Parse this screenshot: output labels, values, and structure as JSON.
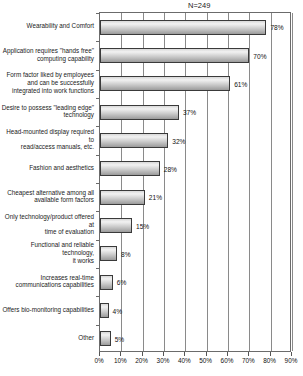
{
  "chart_data": {
    "type": "bar",
    "orientation": "horizontal",
    "title": "N=249",
    "xlabel": "",
    "ylabel": "",
    "xlim": [
      0,
      90
    ],
    "xticks": [
      0,
      10,
      20,
      30,
      40,
      50,
      60,
      70,
      80,
      90
    ],
    "xtick_labels": [
      "0%",
      "10%",
      "20%",
      "30%",
      "40%",
      "50%",
      "60%",
      "70%",
      "80%",
      "90%"
    ],
    "grid": true,
    "legend": false,
    "categories": [
      "Wearability and Comfort",
      "Application requires \"hands free\"\ncomputing capability",
      "Form factor liked by employees\nand can be successfully\nintegrated into work functions",
      "Desire to possess \"leading edge\"\ntechnology",
      "Head-mounted display required to\nread/access manuals, etc.",
      "Fashion and aesthetics",
      "Cheapest alternative among all\navailable form factors",
      "Only technology/product offered at\ntime of evaluation",
      "Functional and reliable technology,\nit works",
      "Increases real-time\ncommunications capabilities",
      "Offers bio-monitoring capabilities",
      "Other"
    ],
    "values": [
      78,
      70,
      61,
      37,
      32,
      28,
      21,
      15,
      8,
      6,
      4,
      5
    ],
    "value_labels": [
      "78%",
      "70%",
      "61%",
      "37%",
      "32%",
      "28%",
      "21%",
      "15%",
      "8%",
      "6%",
      "4%",
      "5%"
    ]
  },
  "style": {
    "bar_fill_light": "#f2f2f2",
    "bar_fill_dark": "#9a9a9a",
    "bar_border": "#3a3a3a",
    "grid_color": "#8a8a8a",
    "axis_color": "#6b6b6b",
    "text_color": "#1a1a1a",
    "background": "#ffffff"
  }
}
